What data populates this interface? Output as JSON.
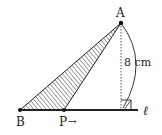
{
  "diagram": {
    "points": {
      "A": {
        "label": "A",
        "x": 121,
        "y": 23
      },
      "B": {
        "label": "B",
        "x": 20,
        "y": 110
      },
      "P": {
        "label": "P",
        "x": 64,
        "y": 110
      }
    },
    "line_label": "ℓ",
    "height_label": "8 cm",
    "p_arrow": "→",
    "shaded_region": "triangle ABP",
    "colors": {
      "stroke": "#222222",
      "hatch": "#333333",
      "background": "#ffffff"
    }
  }
}
